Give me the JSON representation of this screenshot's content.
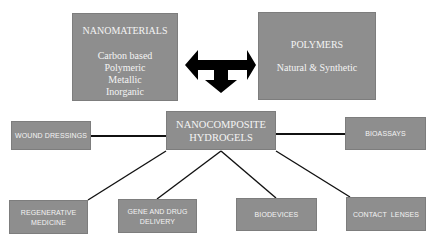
{
  "diagram": {
    "nanomaterials": {
      "title": "NANOMATERIALS",
      "items": [
        "Carbon based",
        "Polymeric",
        "Metallic",
        "Inorganic"
      ]
    },
    "polymers": {
      "title": "POLYMERS",
      "subtitle": "Natural & Synthetic"
    },
    "connector_icon": "t-shaped-three-way-arrow",
    "hub": {
      "line1": "NANOCOMPOSITE",
      "line2": "HYDROGELS"
    },
    "applications": {
      "wound_dressings": "WOUND DRESSINGS",
      "bioassays": "BIOASSAYS",
      "regenerative_line1": "REGENERATIVE",
      "regenerative_line2": "MEDICINE",
      "gene_line1": "GENE AND DRUG",
      "gene_line2": "DELIVERY",
      "biodevices": "BIODEVICES",
      "contact_lenses": "CONTACT  LENSES"
    },
    "colors": {
      "box_fill": "#8e8e8e",
      "box_text": "#f4f4f4",
      "lines": "#000000",
      "background": "#ffffff"
    }
  }
}
